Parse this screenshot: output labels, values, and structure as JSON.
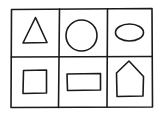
{
  "diagram": {
    "type": "shape-grid",
    "rows": 2,
    "columns": 3,
    "stroke_color": "#1a1a1a",
    "background": "#ffffff",
    "cells": [
      {
        "row": 0,
        "col": 0,
        "shape": "triangle"
      },
      {
        "row": 0,
        "col": 1,
        "shape": "circle"
      },
      {
        "row": 0,
        "col": 2,
        "shape": "ellipse"
      },
      {
        "row": 1,
        "col": 0,
        "shape": "square"
      },
      {
        "row": 1,
        "col": 1,
        "shape": "rectangle"
      },
      {
        "row": 1,
        "col": 2,
        "shape": "pentagon-house"
      }
    ]
  }
}
